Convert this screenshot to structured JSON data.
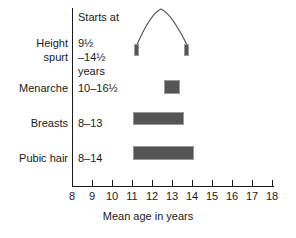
{
  "chart_data": {
    "type": "bar",
    "title": "",
    "xlabel": "Mean age in years",
    "ylabel": "",
    "xlim": [
      8,
      18
    ],
    "xticks": [
      8,
      9,
      10,
      11,
      12,
      13,
      14,
      15,
      16,
      17,
      18
    ],
    "grid": false,
    "legend": false,
    "column_header": "Starts at",
    "categories": [
      "Height spurt",
      "Menarche",
      "Breasts",
      "Pubic hair"
    ],
    "series": [
      {
        "name": "Height spurt",
        "label_line1": "Height",
        "label_line2": "spurt",
        "range_text": [
          "9½",
          "–14½",
          "years"
        ],
        "start": 11.0,
        "end": 13.6,
        "kind": "peak-velocity-curve",
        "marker_ages": [
          11.0,
          13.6
        ]
      },
      {
        "name": "Menarche",
        "label_line1": "Menarche",
        "label_line2": "",
        "range_text": [
          "10–16½"
        ],
        "start": 12.6,
        "end": 13.3,
        "kind": "bar"
      },
      {
        "name": "Breasts",
        "label_line1": "Breasts",
        "label_line2": "",
        "range_text": [
          "8–13"
        ],
        "start": 11.0,
        "end": 13.5,
        "kind": "bar"
      },
      {
        "name": "Pubic hair",
        "label_line1": "Pubic hair",
        "label_line2": "",
        "range_text": [
          "8–14"
        ],
        "start": 11.0,
        "end": 14.0,
        "kind": "bar"
      }
    ],
    "colors": {
      "bar_fill": "#555555",
      "bar_edge": "#9a9a9a",
      "axis": "#1a1a1a",
      "text": "#1a1a1a",
      "curve": "#555555",
      "background": "#ffffff"
    }
  },
  "axis": {
    "ticks": [
      {
        "label": "8"
      },
      {
        "label": "9"
      },
      {
        "label": "10"
      },
      {
        "label": "11"
      },
      {
        "label": "12"
      },
      {
        "label": "13"
      },
      {
        "label": "14"
      },
      {
        "label": "15"
      },
      {
        "label": "16"
      },
      {
        "label": "17"
      },
      {
        "label": "18"
      }
    ],
    "title": "Mean age in years"
  },
  "table": {
    "header": "Starts at",
    "rows": [
      {
        "label_line1": "Height",
        "label_line2": "spurt",
        "range_line1": "9½",
        "range_line2": "–14½",
        "range_line3": "years"
      },
      {
        "label_line1": "Menarche",
        "label_line2": "",
        "range_line1": "10–16½",
        "range_line2": "",
        "range_line3": ""
      },
      {
        "label_line1": "Breasts",
        "label_line2": "",
        "range_line1": "8–13",
        "range_line2": "",
        "range_line3": ""
      },
      {
        "label_line1": "Pubic hair",
        "label_line2": "",
        "range_line1": "8–14",
        "range_line2": "",
        "range_line3": ""
      }
    ]
  }
}
